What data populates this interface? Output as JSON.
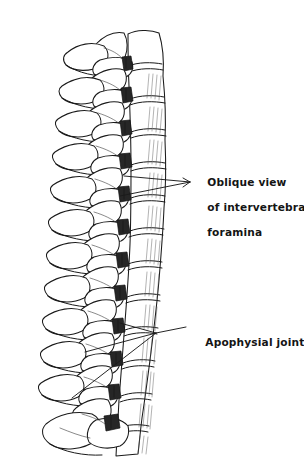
{
  "figure": {
    "kind": "anatomical-line-drawing",
    "background_color": "#ffffff",
    "ink_color": "#1a1a1a",
    "foramen_fill_color": "#262626",
    "width": 304,
    "height": 476
  },
  "annotations": {
    "foramina": {
      "label": "Oblique view\nof intervertebral\nforamina",
      "line1": "Oblique view",
      "line2": "of intervertebral",
      "line3": "foramina",
      "text_x": 192,
      "text_y": 163,
      "leader_count": 2
    },
    "apophysial": {
      "label": "Apophysial joints",
      "text_x": 190,
      "text_y": 323,
      "leader_count": 3
    }
  },
  "vertebrae": {
    "count": 12,
    "top_y": 30,
    "bottom_y": 452,
    "spacing": 33,
    "column_left_x": 108,
    "column_right_x": 168
  }
}
